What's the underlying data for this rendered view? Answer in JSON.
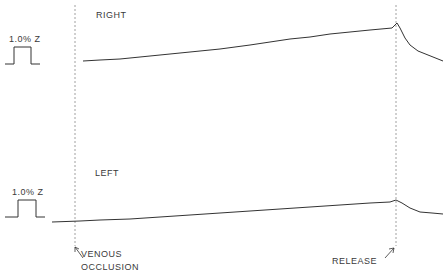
{
  "chart_data": {
    "type": "line",
    "title": "",
    "panels": [
      {
        "label": "RIGHT",
        "calibration": "1.0% Z",
        "trace": [
          [
            83,
            61
          ],
          [
            100,
            60
          ],
          [
            120,
            59
          ],
          [
            140,
            57
          ],
          [
            160,
            55
          ],
          [
            180,
            53
          ],
          [
            200,
            51
          ],
          [
            220,
            49
          ],
          [
            235,
            47
          ],
          [
            250,
            45
          ],
          [
            270,
            42
          ],
          [
            290,
            39
          ],
          [
            310,
            37
          ],
          [
            330,
            34
          ],
          [
            350,
            32
          ],
          [
            370,
            30
          ],
          [
            392,
            28
          ],
          [
            397,
            23
          ],
          [
            400,
            28
          ],
          [
            405,
            38
          ],
          [
            410,
            45
          ],
          [
            418,
            51
          ],
          [
            428,
            55
          ],
          [
            438,
            59
          ],
          [
            443,
            61
          ]
        ]
      },
      {
        "label": "LEFT",
        "calibration": "1.0% Z",
        "trace": [
          [
            52,
            222
          ],
          [
            80,
            221
          ],
          [
            100,
            220
          ],
          [
            130,
            219
          ],
          [
            160,
            217
          ],
          [
            190,
            215
          ],
          [
            220,
            213
          ],
          [
            250,
            211
          ],
          [
            280,
            209
          ],
          [
            310,
            207
          ],
          [
            340,
            205
          ],
          [
            370,
            203
          ],
          [
            390,
            202
          ],
          [
            396,
            200
          ],
          [
            402,
            203
          ],
          [
            410,
            208
          ],
          [
            420,
            212
          ],
          [
            432,
            213
          ],
          [
            443,
            214
          ]
        ]
      }
    ],
    "markers": [
      {
        "label": "VENOUS\nOCCLUSION",
        "x": 75
      },
      {
        "label": "RELEASE",
        "x": 396
      }
    ],
    "xlabel": "",
    "ylabel": "",
    "grid": false
  },
  "labels": {
    "right": "RIGHT",
    "left": "LEFT",
    "cal_top": "1.0% Z",
    "cal_bottom": "1.0% Z",
    "venous_line1": "VENOUS",
    "venous_line2": "OCCLUSION",
    "release": "RELEASE"
  }
}
